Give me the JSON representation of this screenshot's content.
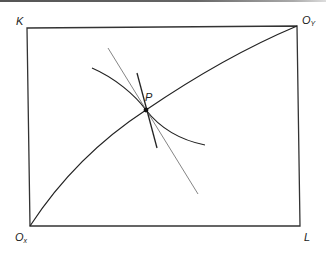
{
  "diagram": {
    "type": "edgeworth-box",
    "labels": {
      "top_left": "K",
      "top_right_main": "O",
      "top_right_sub": "Y",
      "bottom_left_main": "O",
      "bottom_left_sub": "x",
      "bottom_right": "L",
      "point": "P"
    },
    "colors": {
      "line": "#222222",
      "thin_line": "#666666",
      "background": "#ffffff"
    },
    "elements": [
      "box",
      "contract-curve",
      "isoquant",
      "steep-tangent-line",
      "shallow-tangent-line",
      "point-P"
    ]
  }
}
